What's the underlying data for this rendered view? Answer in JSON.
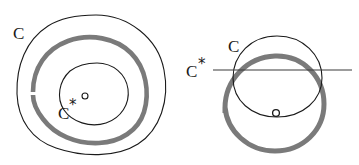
{
  "figure": {
    "background_color": "#ffffff",
    "width": 359,
    "height": 165,
    "ink_color": "#1a1a1a",
    "highlight_color": "#7a7a7a"
  },
  "panels": [
    {
      "id": "left-panel",
      "name": "nested-contours-panel",
      "labels": {
        "outer_curve_label": "C",
        "inner_curve_label": "C",
        "inner_curve_star": "*",
        "point_marker_label": "o"
      },
      "elements": {
        "outer_contour": "large irregular closed curve, thin black",
        "middle_contour": "thick gray closed curve inside outer",
        "inner_contour": "small closed curve, thin black",
        "point_marker": "small open circle"
      }
    },
    {
      "id": "right-panel",
      "name": "overlapping-circles-panel",
      "labels": {
        "thin_circle_label": "C",
        "thick_circle_label": "C",
        "thick_circle_star": "*",
        "point_marker_label": "o"
      },
      "elements": {
        "thin_circle": "thin black circle, upper",
        "thick_circle": "thick gray circle, lower and larger",
        "secant_line": "horizontal straight line crossing both circles",
        "point_marker": "small open circle on lower arc of thin circle"
      }
    }
  ]
}
